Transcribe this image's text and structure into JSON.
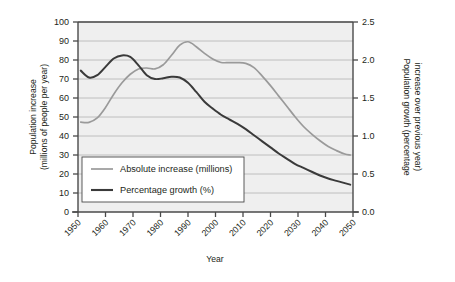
{
  "chart_data": {
    "type": "line",
    "title": "",
    "xlabel": "Year",
    "ylabel": "Population increase (millions of people per year)",
    "ylabel_right": "Population growth (percentage increase over previous year)",
    "xlim": [
      1950,
      2050
    ],
    "ylim": [
      0,
      100
    ],
    "ylim_right": [
      0.0,
      2.5
    ],
    "grid": true,
    "legend_position": "lower-left-inside",
    "xticks": [
      "1950",
      "1960",
      "1970",
      "1980",
      "1990",
      "2000",
      "2010",
      "2020",
      "2030",
      "2040",
      "2050"
    ],
    "yticks": [
      "0",
      "10",
      "20",
      "30",
      "40",
      "50",
      "60",
      "70",
      "80",
      "90",
      "100"
    ],
    "yticks_right": [
      "0.0",
      "0.5",
      "1.0",
      "1.5",
      "2.0",
      "2.5"
    ],
    "x": [
      1951,
      1954,
      1957,
      1960,
      1963,
      1966,
      1969,
      1972,
      1975,
      1978,
      1981,
      1984,
      1987,
      1990,
      1993,
      1996,
      1999,
      2002,
      2005,
      2008,
      2011,
      2014,
      2017,
      2020,
      2023,
      2026,
      2029,
      2032,
      2035,
      2038,
      2041,
      2044,
      2047,
      2049
    ],
    "series": [
      {
        "name": "Absolute increase (millions)",
        "axis": "left",
        "units": "millions of people per year",
        "color": "#9a9a9a",
        "values": [
          47.3,
          47.2,
          49.5,
          55.0,
          62.0,
          68.0,
          72.5,
          75.3,
          75.8,
          75.3,
          77.5,
          82.5,
          87.8,
          89.6,
          87.0,
          83.5,
          80.5,
          78.7,
          78.6,
          78.6,
          78.2,
          76.0,
          71.5,
          66.5,
          61.0,
          55.5,
          50.0,
          45.0,
          41.0,
          37.5,
          34.5,
          32.3,
          30.5,
          30.0
        ]
      },
      {
        "name": "Percentage growth (%)",
        "axis": "right",
        "units": "percent increase over previous year",
        "color": "#3a3a3a",
        "values": [
          1.86,
          1.77,
          1.8,
          1.91,
          2.02,
          2.06,
          2.04,
          1.93,
          1.8,
          1.75,
          1.76,
          1.78,
          1.77,
          1.7,
          1.58,
          1.45,
          1.36,
          1.28,
          1.22,
          1.16,
          1.09,
          1.01,
          0.93,
          0.85,
          0.77,
          0.7,
          0.63,
          0.58,
          0.53,
          0.48,
          0.44,
          0.41,
          0.38,
          0.36
        ]
      }
    ]
  },
  "legend": {
    "items": [
      {
        "label": "Absolute increase (millions)",
        "color": "#9a9a9a"
      },
      {
        "label": "Percentage growth (%)",
        "color": "#3a3a3a"
      }
    ]
  },
  "axes": {
    "left_title": "Population increase",
    "left_subtitle": "(millions of people per year)",
    "right_title": "Population growth (percentage",
    "right_subtitle": "increase over previous year)",
    "x_title": "Year"
  },
  "style": {
    "plot_background": "#efefef",
    "grid_color": "#b9b9b9",
    "axis_color": "#4a4a4a",
    "page_background": "#ffffff"
  }
}
